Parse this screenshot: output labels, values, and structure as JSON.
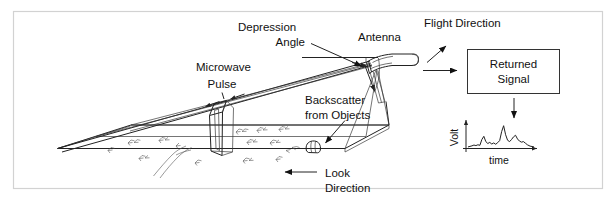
{
  "figure": {
    "background_color": "#ffffff",
    "frame_color": "#d2d2d2",
    "ink_color": "#222222"
  },
  "labels": {
    "depression_angle": "Depression\nAngle",
    "depression_angle_line1": "Depression",
    "depression_angle_line2": "Angle",
    "antenna": "Antenna",
    "flight_direction": "Flight Direction",
    "microwave_pulse_line1": "Microwave",
    "microwave_pulse_line2": "Pulse",
    "backscatter_line1": "Backscatter",
    "backscatter_line2": "from Objects",
    "look_direction_line1": "Look",
    "look_direction_line2": "Direction",
    "returned_signal_line1": "Returned",
    "returned_signal_line2": "Signal"
  },
  "returned_signal_box": {
    "line1": "Returned",
    "line2": "Signal",
    "border_color": "#333333"
  },
  "chart_data": {
    "type": "line",
    "title": "",
    "xlabel": "time",
    "ylabel": "Volt",
    "grid": false,
    "legend": null,
    "xlim": [
      0,
      100
    ],
    "ylim": [
      0,
      10
    ],
    "x": [
      0,
      3,
      6,
      9,
      12,
      15,
      18,
      21,
      24,
      27,
      30,
      33,
      36,
      39,
      42,
      45,
      48,
      51,
      54,
      57,
      60,
      63,
      66,
      69,
      72,
      75,
      78,
      81,
      84,
      87,
      90,
      94,
      100
    ],
    "values": [
      0.6,
      0.8,
      1.0,
      1.3,
      1.1,
      1.4,
      1.2,
      3.4,
      4.6,
      2.6,
      1.9,
      2.3,
      1.7,
      2.1,
      1.6,
      2.2,
      3.0,
      6.4,
      8.6,
      5.2,
      3.1,
      2.6,
      3.4,
      4.4,
      5.0,
      3.6,
      2.8,
      2.4,
      2.6,
      2.0,
      1.4,
      0.9,
      0.6
    ],
    "axis_color": "#333333",
    "line_color": "#333333"
  },
  "scene": {
    "ground_swath_label": "radar ground swath",
    "vegetation_count": 13,
    "river_label": "river",
    "beam_label": "radar beam fan"
  }
}
